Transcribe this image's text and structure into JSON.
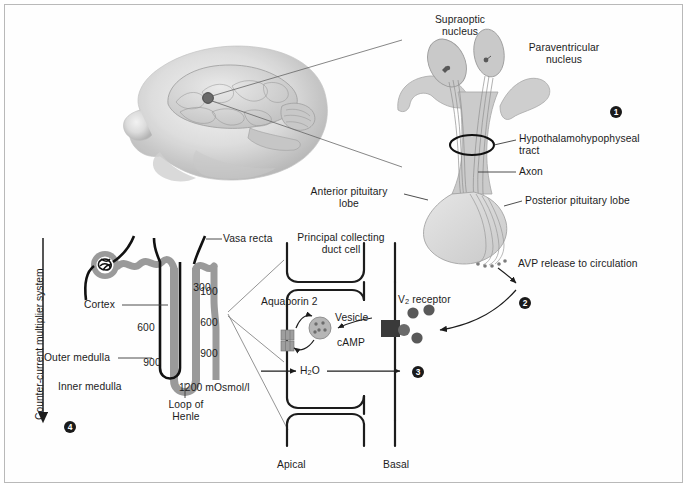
{
  "figure": {
    "background": "#ffffff",
    "border_color": "#b9b9b9",
    "ink_color": "#1c1c1c",
    "tissue_gray": "#d8d8d8",
    "tubule_gray": "#9a9a9a",
    "dark_gray": "#4a4a4a"
  },
  "steps": [
    {
      "id": "1",
      "label": "1"
    },
    {
      "id": "2",
      "label": "2"
    },
    {
      "id": "3",
      "label": "3"
    },
    {
      "id": "4",
      "label": "4"
    }
  ],
  "hypothalamus": {
    "supraoptic_nucleus": "Supraoptic\nnucleus",
    "paraventricular_nucleus": "Paraventricular\nnucleus",
    "hypothalamohypophyseal_tract": "Hypothalamohypophyseal\ntract",
    "axon": "Axon",
    "anterior_pituitary_lobe": "Anterior pituitary\nlobe",
    "posterior_pituitary_lobe": "Posterior pituitary lobe",
    "avp_release": "AVP release to circulation"
  },
  "nephron": {
    "counter_current": "Counter-current multiplier system",
    "vasa_recta": "Vasa recta",
    "cortex": "Cortex",
    "outer_medulla": "Outer medulla",
    "inner_medulla": "Inner medulla",
    "loop_of_henle": "Loop of\nHenle",
    "osmolality_values": [
      {
        "value": "300",
        "x": 192,
        "y": 287
      },
      {
        "value": "100",
        "x": 205,
        "y": 291
      },
      {
        "value": "600",
        "x": 135,
        "y": 328
      },
      {
        "value": "600",
        "x": 205,
        "y": 322
      },
      {
        "value": "900",
        "x": 205,
        "y": 353
      },
      {
        "value": "900",
        "x": 141,
        "y": 362
      },
      {
        "value": "1200 mOsmol/l",
        "x": 180,
        "y": 388
      }
    ]
  },
  "collecting_duct_cell": {
    "title": "Principal collecting\nduct cell",
    "aquaporin": "Aquaporin 2",
    "vesicle": "Vesicle",
    "camp": "cAMP",
    "v2_receptor_pre": "V",
    "v2_receptor_sub": "2",
    "v2_receptor_post": " receptor",
    "water_pre": "H",
    "water_sub": "2",
    "water_post": "O",
    "apical": "Apical",
    "basal": "Basal"
  }
}
